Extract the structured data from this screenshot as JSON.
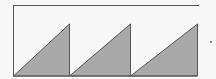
{
  "figure": {
    "colors": {
      "background": "#f7f7f7",
      "stroke": "#555555",
      "fill": "#a9a9a9"
    },
    "frame": {
      "top_line": {
        "x1": 13,
        "y1": 5.5,
        "x2": 199,
        "y2": 5.5
      },
      "left_line": {
        "x1": 13.5,
        "y1": 5,
        "x2": 13.5,
        "y2": 76
      },
      "bottom_line": {
        "x1": 13,
        "y1": 76,
        "x2": 197,
        "y2": 76
      }
    },
    "triangles": [
      {
        "points": "13.5,76 69.5,24 69.5,76"
      },
      {
        "points": "69.5,76 130.5,24 130.5,76"
      },
      {
        "points": "130.5,76 197.5,24 197.5,76"
      }
    ],
    "dot": {
      "cx": 211,
      "cy": 42,
      "r": 0.9
    }
  }
}
